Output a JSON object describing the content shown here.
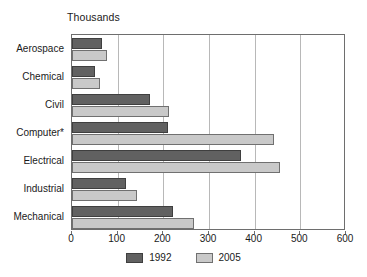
{
  "chart_data": {
    "type": "bar",
    "orientation": "horizontal",
    "title": "Thousands",
    "xlabel": "",
    "ylabel": "",
    "xlim": [
      0,
      600
    ],
    "xticks": [
      0,
      100,
      200,
      300,
      400,
      500,
      600
    ],
    "grid": true,
    "legend_position": "bottom",
    "categories": [
      "Aerospace",
      "Chemical",
      "Civil",
      "Computer*",
      "Electrical",
      "Industrial",
      "Mechanical"
    ],
    "series": [
      {
        "name": "1992",
        "color": "#616161",
        "values": [
          66,
          50,
          171,
          210,
          370,
          118,
          222
        ]
      },
      {
        "name": "2005",
        "color": "#c9c9c9",
        "values": [
          77,
          61,
          212,
          442,
          455,
          142,
          268
        ]
      }
    ]
  },
  "legend": {
    "items": [
      {
        "label": "1992",
        "color": "#616161"
      },
      {
        "label": "2005",
        "color": "#c9c9c9"
      }
    ]
  }
}
